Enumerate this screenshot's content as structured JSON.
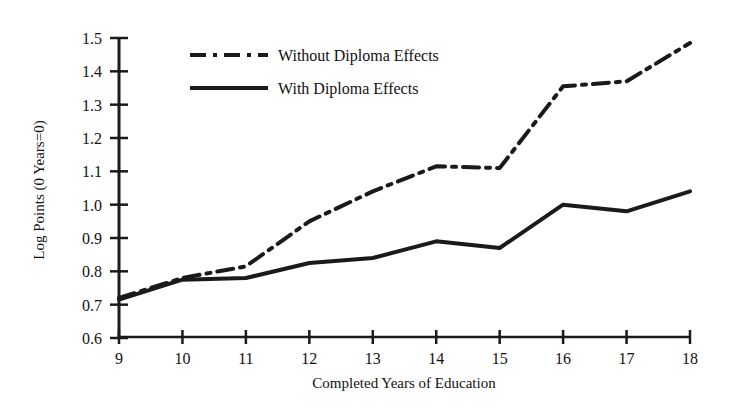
{
  "chart_data": {
    "type": "line",
    "title": "",
    "xlabel": "Completed Years of Education",
    "ylabel": "Log Points  (0 Years=0)",
    "x": [
      9,
      10,
      11,
      12,
      13,
      14,
      15,
      16,
      17,
      18
    ],
    "xtick_labels": [
      "9",
      "10",
      "11",
      "12",
      "13",
      "14",
      "15",
      "16",
      "17",
      "18"
    ],
    "ytick_labels": [
      "0.6",
      "0.7",
      "0.8",
      "0.9",
      "1.0",
      "1.1",
      "1.2",
      "1.3",
      "1.4",
      "1.5"
    ],
    "ytick_values": [
      0.6,
      0.7,
      0.8,
      0.9,
      1.0,
      1.1,
      1.2,
      1.3,
      1.4,
      1.5
    ],
    "xlim": [
      9,
      18
    ],
    "ylim": [
      0.6,
      1.5
    ],
    "grid": false,
    "legend_position": "upper-left-inside",
    "series": [
      {
        "name": "Without Diploma Effects",
        "style": "dash-dot",
        "color": "#1a1a1a",
        "values": [
          0.72,
          0.78,
          0.815,
          0.95,
          1.04,
          1.115,
          1.11,
          1.355,
          1.37,
          1.485
        ]
      },
      {
        "name": "With Diploma Effects",
        "style": "solid",
        "color": "#1a1a1a",
        "values": [
          0.715,
          0.775,
          0.78,
          0.825,
          0.84,
          0.89,
          0.87,
          1.0,
          0.98,
          1.04
        ]
      }
    ]
  },
  "legend": {
    "items": [
      {
        "label": "Without Diploma Effects"
      },
      {
        "label": "With Diploma Effects"
      }
    ]
  }
}
